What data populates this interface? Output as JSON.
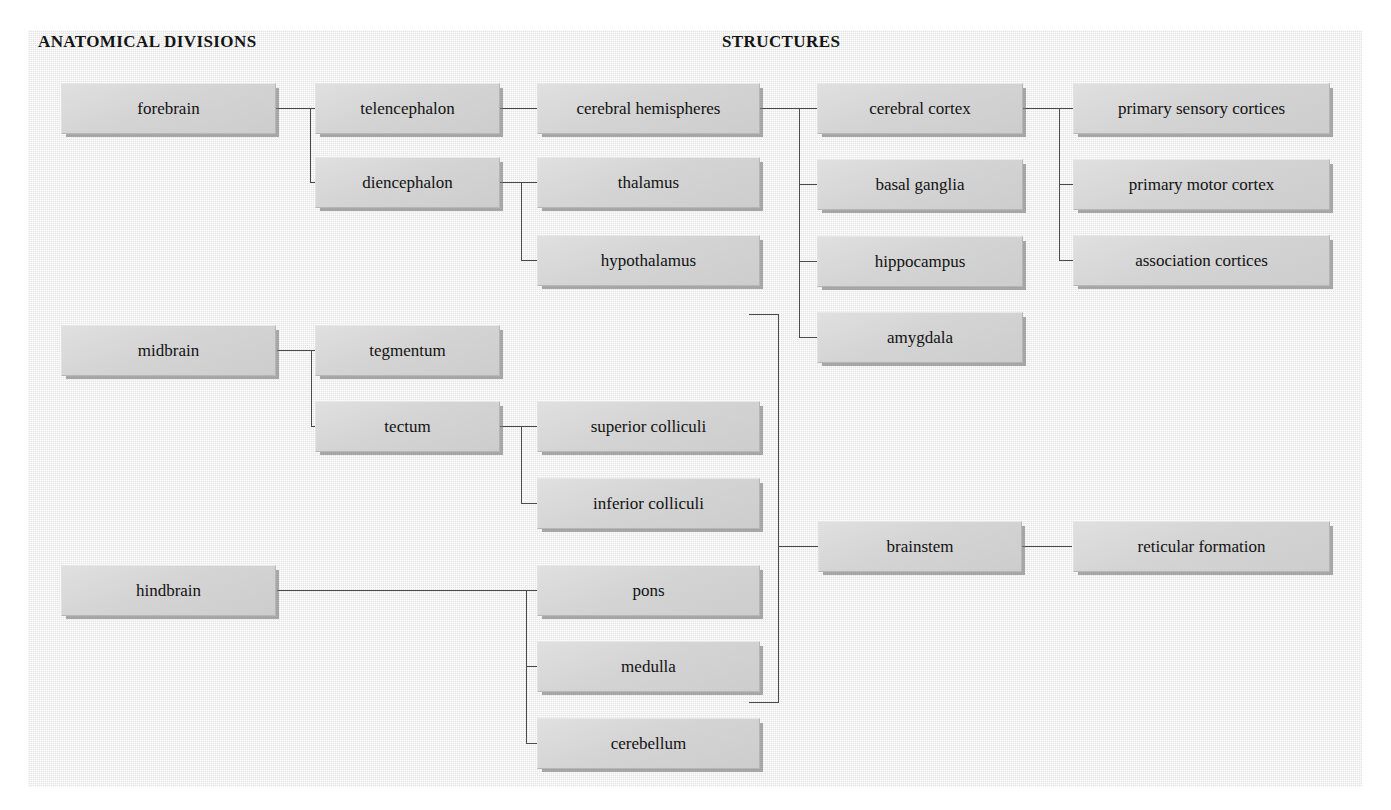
{
  "headers": {
    "left": "ANATOMICAL DIVISIONS",
    "right": "STRUCTURES"
  },
  "colors": {
    "page_background": "#ffffff",
    "paper_background": "#eeeeee",
    "box_fill": "#d6d6d6",
    "box_border": "#b6b6b6",
    "box_shadow": "#787878",
    "line": "#4a4a4a",
    "text": "#121212"
  },
  "nodes": {
    "forebrain": "forebrain",
    "telencephalon": "telencephalon",
    "diencephalon": "diencephalon",
    "cerebral_hemispheres": "cerebral hemispheres",
    "thalamus": "thalamus",
    "hypothalamus": "hypothalamus",
    "cerebral_cortex": "cerebral cortex",
    "basal_ganglia": "basal ganglia",
    "hippocampus": "hippocampus",
    "amygdala": "amygdala",
    "primary_sensory_cortices": "primary sensory cortices",
    "primary_motor_cortex": "primary motor cortex",
    "association_cortices": "association cortices",
    "midbrain": "midbrain",
    "tegmentum": "tegmentum",
    "tectum": "tectum",
    "superior_colliculi": "superior colliculi",
    "inferior_colliculi": "inferior colliculi",
    "brainstem": "brainstem",
    "reticular_formation": "reticular formation",
    "hindbrain": "hindbrain",
    "pons": "pons",
    "medulla": "medulla",
    "cerebellum": "cerebellum"
  },
  "hierarchy": [
    {
      "parent": "forebrain",
      "children": [
        "telencephalon",
        "diencephalon"
      ]
    },
    {
      "parent": "telencephalon",
      "children": [
        "cerebral hemispheres"
      ]
    },
    {
      "parent": "diencephalon",
      "children": [
        "thalamus",
        "hypothalamus"
      ]
    },
    {
      "parent": "cerebral hemispheres",
      "children": [
        "cerebral cortex",
        "basal ganglia",
        "hippocampus",
        "amygdala"
      ]
    },
    {
      "parent": "cerebral cortex",
      "children": [
        "primary sensory cortices",
        "primary motor cortex",
        "association cortices"
      ]
    },
    {
      "parent": "midbrain",
      "children": [
        "tegmentum",
        "tectum"
      ]
    },
    {
      "parent": "tectum",
      "children": [
        "superior colliculi",
        "inferior colliculi"
      ]
    },
    {
      "parent": "brainstem",
      "children": [
        "reticular formation"
      ]
    },
    {
      "parent": "hindbrain",
      "children": [
        "pons",
        "medulla",
        "cerebellum"
      ]
    }
  ]
}
